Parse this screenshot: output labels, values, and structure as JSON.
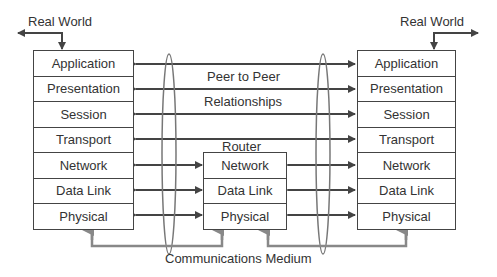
{
  "left_host": {
    "real_world_label": "Real World",
    "layers": [
      "Application",
      "Presentation",
      "Session",
      "Transport",
      "Network",
      "Data Link",
      "Physical"
    ]
  },
  "right_host": {
    "real_world_label": "Real World",
    "layers": [
      "Application",
      "Presentation",
      "Session",
      "Transport",
      "Network",
      "Data Link",
      "Physical"
    ]
  },
  "router": {
    "title": "Router",
    "layers": [
      "Network",
      "Data Link",
      "Physical"
    ]
  },
  "annotations": {
    "peer_line1": "Peer to Peer",
    "peer_line2": "Relationships",
    "medium": "Communications Medium"
  },
  "colors": {
    "line": "#444444",
    "medium_arrow": "#888888",
    "ellipse": "#777777"
  }
}
